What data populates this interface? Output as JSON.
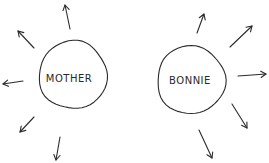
{
  "diagram": {
    "style": "hand-drawn sketch",
    "ink_color": "#2b2b2b",
    "background": "#ffffff",
    "nodes": [
      {
        "id": "mother",
        "label": "MOTHER",
        "shape": "circle",
        "cx": 73,
        "cy": 75,
        "r": 34,
        "label_pos": {
          "x": 69,
          "y": 78
        },
        "outgoing_arrows": [
          {
            "direction": "up",
            "from": [
              70,
              29
            ],
            "to": [
              65,
              5
            ]
          },
          {
            "direction": "up-left",
            "from": [
              34,
              48
            ],
            "to": [
              18,
              31
            ]
          },
          {
            "direction": "left",
            "from": [
              23,
              81
            ],
            "to": [
              3,
              84
            ]
          },
          {
            "direction": "down-left",
            "from": [
              34,
              117
            ],
            "to": [
              20,
              132
            ]
          },
          {
            "direction": "down",
            "from": [
              60,
              137
            ],
            "to": [
              56,
              160
            ]
          }
        ]
      },
      {
        "id": "bonnie",
        "label": "BONNIE",
        "shape": "circle",
        "cx": 191,
        "cy": 80,
        "r": 34,
        "label_pos": {
          "x": 190,
          "y": 80
        },
        "outgoing_arrows": [
          {
            "direction": "up",
            "from": [
              197,
              33
            ],
            "to": [
              204,
              14
            ]
          },
          {
            "direction": "up-right",
            "from": [
              230,
              47
            ],
            "to": [
              252,
              26
            ]
          },
          {
            "direction": "right",
            "from": [
              238,
              76
            ],
            "to": [
              266,
              74
            ]
          },
          {
            "direction": "down-right",
            "from": [
              232,
              104
            ],
            "to": [
              247,
              128
            ]
          },
          {
            "direction": "down",
            "from": [
              199,
              130
            ],
            "to": [
              212,
              158
            ]
          }
        ]
      }
    ]
  }
}
